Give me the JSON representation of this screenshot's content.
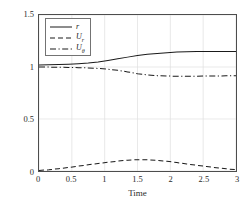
{
  "chart_data": {
    "type": "line",
    "title": "",
    "xlabel": "Time",
    "ylabel": "States",
    "xlim": [
      0,
      3
    ],
    "ylim": [
      0,
      1.5
    ],
    "xticks": [
      "0",
      "0.5",
      "1",
      "1.5",
      "2",
      "2.5",
      "3"
    ],
    "xtick_values": [
      0,
      0.5,
      1,
      1.5,
      2,
      2.5,
      3
    ],
    "yticks": [
      "0",
      "0.5",
      "1",
      "1.5"
    ],
    "ytick_values": [
      0,
      0.5,
      1,
      1.5
    ],
    "grid": true,
    "legend_position": "upper left",
    "x": [
      0,
      0.15,
      0.3,
      0.45,
      0.6,
      0.75,
      0.9,
      1.05,
      1.2,
      1.35,
      1.5,
      1.65,
      1.8,
      1.95,
      2.1,
      2.25,
      2.4,
      2.55,
      2.7,
      2.85,
      3
    ],
    "series": [
      {
        "name": "r",
        "label": "r",
        "style": "solid",
        "color": "#1a1a1a",
        "values": [
          1.02,
          1.021,
          1.023,
          1.026,
          1.031,
          1.038,
          1.049,
          1.063,
          1.079,
          1.095,
          1.11,
          1.122,
          1.131,
          1.138,
          1.143,
          1.146,
          1.148,
          1.149,
          1.15,
          1.15,
          1.15
        ]
      },
      {
        "name": "U_r",
        "label": "U",
        "sublabel": "r",
        "style": "dashed",
        "color": "#1a1a1a",
        "values": [
          0.005,
          0.012,
          0.022,
          0.034,
          0.047,
          0.06,
          0.072,
          0.084,
          0.095,
          0.104,
          0.109,
          0.108,
          0.102,
          0.093,
          0.081,
          0.068,
          0.055,
          0.043,
          0.031,
          0.021,
          0.013
        ]
      },
      {
        "name": "U_theta",
        "label": "U",
        "sublabel": "θ",
        "style": "dashdot",
        "color": "#1a1a1a",
        "values": [
          1.0,
          0.999,
          0.998,
          0.996,
          0.994,
          0.991,
          0.986,
          0.979,
          0.968,
          0.953,
          0.936,
          0.924,
          0.917,
          0.913,
          0.911,
          0.911,
          0.912,
          0.913,
          0.914,
          0.915,
          0.916
        ]
      }
    ]
  },
  "legend": {
    "entries": [
      {
        "label": "r",
        "sub": ""
      },
      {
        "label": "U",
        "sub": "r"
      },
      {
        "label": "U",
        "sub": "θ"
      }
    ]
  },
  "axis": {
    "x_label": "Time",
    "y_label": "States"
  },
  "colors": {
    "axis": "#4d4d4d",
    "grid": "#e0e0e0",
    "line": "#1a1a1a",
    "background": "#ffffff"
  }
}
